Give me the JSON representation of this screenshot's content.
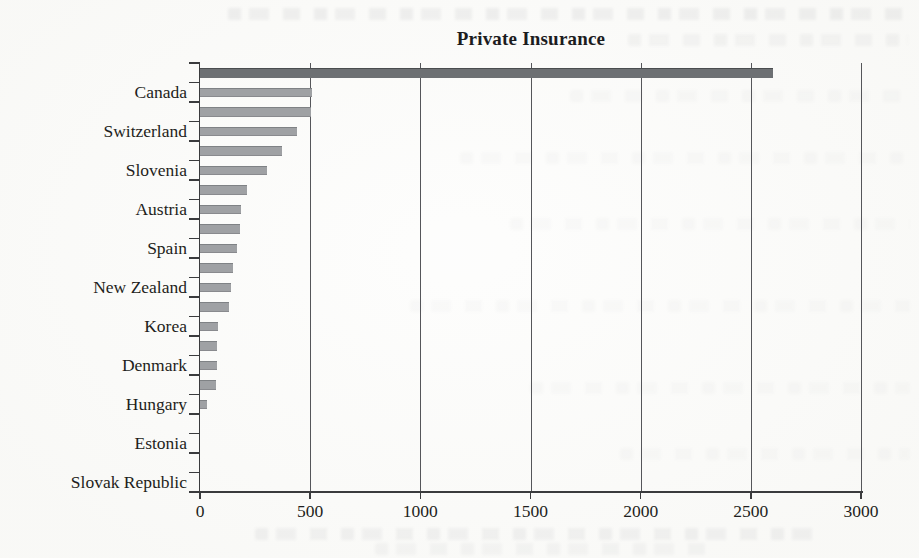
{
  "page": {
    "kind": "scanned book figure",
    "background_color": "#fbfbf9"
  },
  "chart_data": {
    "type": "bar",
    "orientation": "horizontal",
    "title": "Private Insurance",
    "xlabel": "",
    "ylabel": "",
    "x_axis": {
      "min": 0,
      "max": 3000,
      "tick_values": [
        0,
        500,
        1000,
        1500,
        2000,
        2500,
        3000
      ],
      "tick_labels": [
        "0",
        "500",
        "1000",
        "1500",
        "2000",
        "2500",
        "3000"
      ]
    },
    "grid": "vertical gridlines at each x tick, drawn behind bars",
    "legend_position": "none",
    "label_pattern": "country labels shown on every second row; rows between are unlabeled bars",
    "rows": [
      {
        "label": "",
        "value": 2600,
        "emphasis": true
      },
      {
        "label": "Canada",
        "value": 510,
        "emphasis": false
      },
      {
        "label": "",
        "value": 505,
        "emphasis": false
      },
      {
        "label": "Switzerland",
        "value": 440,
        "emphasis": false
      },
      {
        "label": "",
        "value": 370,
        "emphasis": false
      },
      {
        "label": "Slovenia",
        "value": 305,
        "emphasis": false
      },
      {
        "label": "",
        "value": 215,
        "emphasis": false
      },
      {
        "label": "Austria",
        "value": 185,
        "emphasis": false
      },
      {
        "label": "",
        "value": 180,
        "emphasis": false
      },
      {
        "label": "Spain",
        "value": 170,
        "emphasis": false
      },
      {
        "label": "",
        "value": 150,
        "emphasis": false
      },
      {
        "label": "New Zealand",
        "value": 140,
        "emphasis": false
      },
      {
        "label": "",
        "value": 130,
        "emphasis": false
      },
      {
        "label": "Korea",
        "value": 80,
        "emphasis": false
      },
      {
        "label": "",
        "value": 75,
        "emphasis": false
      },
      {
        "label": "Denmark",
        "value": 75,
        "emphasis": false
      },
      {
        "label": "",
        "value": 72,
        "emphasis": false
      },
      {
        "label": "Hungary",
        "value": 30,
        "emphasis": false
      },
      {
        "label": "",
        "value": 0,
        "emphasis": false
      },
      {
        "label": "Estonia",
        "value": 0,
        "emphasis": false
      },
      {
        "label": "",
        "value": 0,
        "emphasis": false
      },
      {
        "label": "Slovak Republic",
        "value": 0,
        "emphasis": false
      }
    ],
    "colors": {
      "bar": "#9fa1a4",
      "bar_emphasis": "#6d7073",
      "axis": "#3a3b3d",
      "gridline": "#55565a",
      "text": "#1e1e20"
    }
  }
}
